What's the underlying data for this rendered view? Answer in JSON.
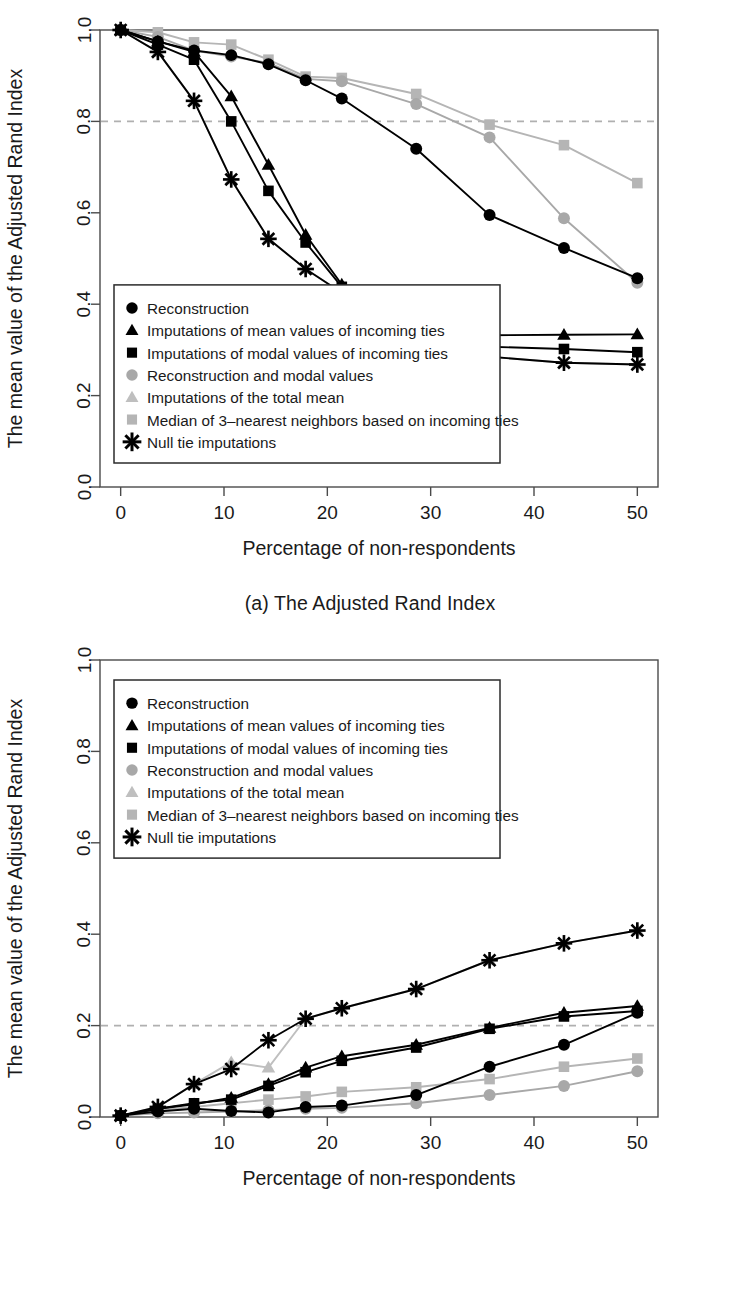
{
  "figure": {
    "panels": [
      {
        "id": "a",
        "caption": "(a) The Adjusted Rand Index"
      },
      {
        "id": "b",
        "caption": "(b) Proportion of incorrect block types"
      }
    ]
  },
  "legend": {
    "items": [
      {
        "label": "Reconstruction",
        "marker": "circle",
        "color": "#000000"
      },
      {
        "label": "Imputations of mean values of incoming ties",
        "marker": "triangle",
        "color": "#000000"
      },
      {
        "label": "Imputations of modal values of incoming ties",
        "marker": "square",
        "color": "#000000"
      },
      {
        "label": "Reconstruction and modal values",
        "marker": "circle",
        "color": "#a8a8a8"
      },
      {
        "label": "Imputations of the total mean",
        "marker": "triangle",
        "color": "#bfbfbf"
      },
      {
        "label": "Median of 3–nearest neighbors based on incoming ties",
        "marker": "square",
        "color": "#b5b5b5"
      },
      {
        "label": "Null tie imputations",
        "marker": "asterisk",
        "color": "#000000"
      }
    ]
  },
  "chart_data": [
    {
      "panel": "a",
      "type": "line",
      "title": "(a) The Adjusted Rand Index",
      "xlabel": "Percentage of non-respondents",
      "ylabel": "The mean value of the Adjusted Rand Index",
      "xlim": [
        -2,
        52
      ],
      "ylim": [
        0.0,
        1.0
      ],
      "xticks": [
        0,
        10,
        20,
        30,
        40,
        50
      ],
      "xtick_labels": [
        "0",
        "10",
        "20",
        "30",
        "40",
        "50"
      ],
      "yticks": [
        0.0,
        0.2,
        0.4,
        0.6,
        0.8,
        1.0
      ],
      "ytick_labels": [
        "0.0",
        "0.2",
        "0.4",
        "0.6",
        "0.8",
        "1.0"
      ],
      "grid": false,
      "legend_position": "bottom-left",
      "reference_line": {
        "y": 0.8,
        "style": "dashed",
        "color": "#b0b0b0"
      },
      "x": [
        0,
        3.6,
        7.1,
        10.7,
        14.3,
        17.9,
        21.4,
        28.6,
        35.7,
        42.9,
        50
      ],
      "series": [
        {
          "name": "Reconstruction",
          "marker": "circle",
          "color": "#000000",
          "values": [
            1.0,
            0.975,
            0.955,
            0.945,
            0.925,
            0.89,
            0.85,
            0.74,
            0.595,
            0.523,
            0.457
          ]
        },
        {
          "name": "Imputations of mean values of incoming ties",
          "marker": "triangle",
          "color": "#000000",
          "values": [
            1.0,
            0.975,
            0.952,
            0.855,
            0.705,
            0.552,
            0.443,
            0.368,
            0.332,
            0.333,
            0.334
          ]
        },
        {
          "name": "Imputations of modal values of incoming ties",
          "marker": "square",
          "color": "#000000",
          "values": [
            1.0,
            0.968,
            0.935,
            0.8,
            0.648,
            0.535,
            0.438,
            0.36,
            0.307,
            0.302,
            0.295
          ]
        },
        {
          "name": "Reconstruction and modal values",
          "marker": "circle",
          "color": "#a8a8a8",
          "values": [
            1.0,
            0.985,
            0.955,
            0.942,
            0.928,
            0.893,
            0.888,
            0.838,
            0.765,
            0.588,
            0.447
          ]
        },
        {
          "name": "Imputations of the total mean",
          "marker": "triangle",
          "color": "#bfbfbf",
          "values": [
            1.0,
            0.952,
            0.845,
            0.673,
            0.543,
            0.477,
            0.425,
            0.345,
            0.285,
            0.272,
            0.268
          ]
        },
        {
          "name": "Median of 3–nearest neighbors based on incoming ties",
          "marker": "square",
          "color": "#b5b5b5",
          "values": [
            1.0,
            0.995,
            0.973,
            0.968,
            0.935,
            0.898,
            0.895,
            0.86,
            0.793,
            0.748,
            0.665
          ]
        },
        {
          "name": "Null tie imputations",
          "marker": "asterisk",
          "color": "#000000",
          "values": [
            1.0,
            0.952,
            0.845,
            0.673,
            0.543,
            0.477,
            0.425,
            0.345,
            0.285,
            0.272,
            0.268
          ]
        }
      ]
    },
    {
      "panel": "b",
      "type": "line",
      "title": "(b) Proportion of incorrect block types",
      "xlabel": "Percentage of non-respondents",
      "ylabel": "The mean value of the Adjusted Rand Index",
      "xlim": [
        -2,
        52
      ],
      "ylim": [
        0.0,
        1.0
      ],
      "xticks": [
        0,
        10,
        20,
        30,
        40,
        50
      ],
      "xtick_labels": [
        "0",
        "10",
        "20",
        "30",
        "40",
        "50"
      ],
      "yticks": [
        0.0,
        0.2,
        0.4,
        0.6,
        0.8,
        1.0
      ],
      "ytick_labels": [
        "0.0",
        "0.2",
        "0.4",
        "0.6",
        "0.8",
        "1.0"
      ],
      "grid": false,
      "legend_position": "top-left",
      "reference_line": {
        "y": 0.2,
        "style": "dashed",
        "color": "#b0b0b0"
      },
      "x": [
        0,
        3.6,
        7.1,
        10.7,
        14.3,
        17.9,
        21.4,
        28.6,
        35.7,
        42.9,
        50
      ],
      "series": [
        {
          "name": "Reconstruction",
          "marker": "circle",
          "color": "#000000",
          "values": [
            0.003,
            0.012,
            0.018,
            0.013,
            0.01,
            0.022,
            0.025,
            0.048,
            0.11,
            0.158,
            0.228
          ]
        },
        {
          "name": "Imputations of mean values of incoming ties",
          "marker": "triangle",
          "color": "#000000",
          "values": [
            0.003,
            0.018,
            0.028,
            0.042,
            0.072,
            0.108,
            0.133,
            0.158,
            0.195,
            0.228,
            0.243
          ]
        },
        {
          "name": "Imputations of modal values of incoming ties",
          "marker": "square",
          "color": "#000000",
          "values": [
            0.003,
            0.018,
            0.03,
            0.038,
            0.068,
            0.098,
            0.123,
            0.152,
            0.193,
            0.22,
            0.232
          ]
        },
        {
          "name": "Reconstruction and modal values",
          "marker": "circle",
          "color": "#a8a8a8",
          "values": [
            0.003,
            0.008,
            0.01,
            0.012,
            0.015,
            0.018,
            0.02,
            0.03,
            0.048,
            0.068,
            0.1
          ]
        },
        {
          "name": "Imputations of the total mean",
          "marker": "triangle",
          "color": "#bfbfbf",
          "values": [
            0.003,
            0.022,
            0.072,
            0.12,
            0.108,
            0.215,
            0.238,
            0.28,
            0.343,
            0.38,
            0.408
          ]
        },
        {
          "name": "Median of 3–nearest neighbors based on incoming ties",
          "marker": "square",
          "color": "#b5b5b5",
          "values": [
            0.003,
            0.015,
            0.022,
            0.03,
            0.038,
            0.045,
            0.055,
            0.065,
            0.083,
            0.11,
            0.128
          ]
        },
        {
          "name": "Null tie imputations",
          "marker": "asterisk",
          "color": "#000000",
          "values": [
            0.003,
            0.022,
            0.072,
            0.105,
            0.168,
            0.215,
            0.238,
            0.28,
            0.343,
            0.38,
            0.408
          ]
        }
      ]
    }
  ]
}
